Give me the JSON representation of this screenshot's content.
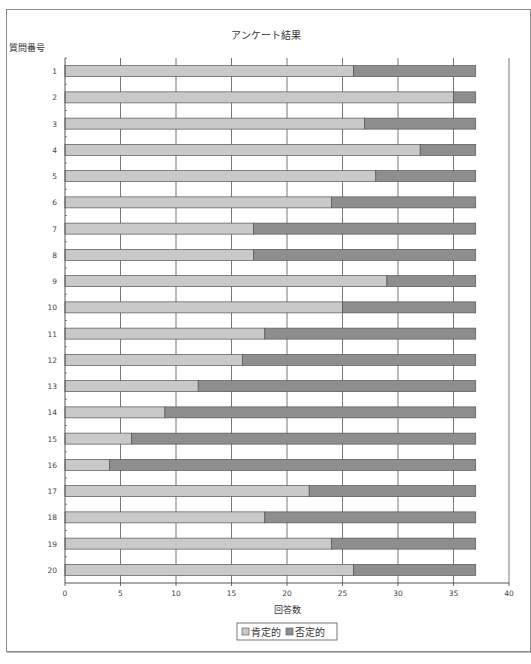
{
  "chart_data": {
    "type": "bar",
    "orientation": "horizontal",
    "stacked": true,
    "title": "アンケート結果",
    "ylabel": "質問番号",
    "xlabel": "回答数",
    "xlim": [
      0,
      40
    ],
    "xticks": [
      0,
      5,
      10,
      15,
      20,
      25,
      30,
      35,
      40
    ],
    "grid": "vertical",
    "legend_position": "bottom",
    "categories": [
      "1",
      "2",
      "3",
      "4",
      "5",
      "6",
      "7",
      "8",
      "9",
      "10",
      "11",
      "12",
      "13",
      "14",
      "15",
      "16",
      "17",
      "18",
      "19",
      "20"
    ],
    "series": [
      {
        "name": "肯定的",
        "color": "#c9c9c9",
        "values": [
          26,
          35,
          27,
          32,
          28,
          24,
          17,
          17,
          29,
          25,
          18,
          16,
          12,
          9,
          6,
          4,
          22,
          18,
          24,
          26
        ]
      },
      {
        "name": "否定的",
        "color": "#8e8e8e",
        "values": [
          11,
          2,
          10,
          5,
          9,
          13,
          20,
          20,
          8,
          12,
          19,
          21,
          25,
          28,
          31,
          33,
          15,
          19,
          13,
          11
        ]
      }
    ]
  }
}
